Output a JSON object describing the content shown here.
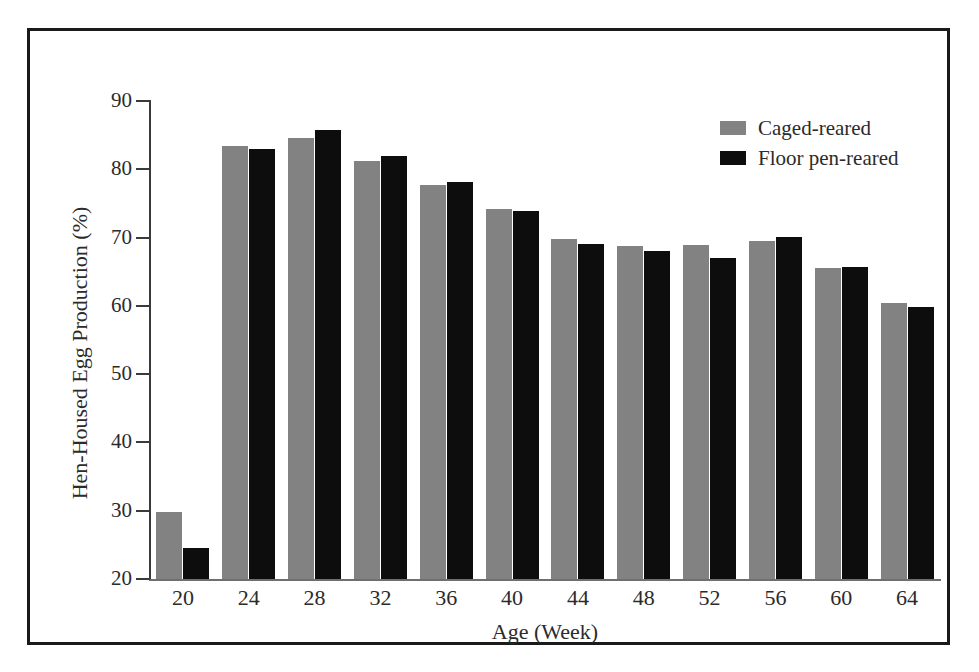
{
  "figure": {
    "border_color": "#1a1a1a",
    "background": "#ffffff"
  },
  "chart_data": {
    "type": "bar",
    "title": "",
    "xlabel": "Age (Week)",
    "ylabel": "Hen-Housed Egg Production (%)",
    "categories": [
      "20",
      "24",
      "28",
      "32",
      "36",
      "40",
      "44",
      "48",
      "52",
      "56",
      "60",
      "64"
    ],
    "series": [
      {
        "name": "Caged-reared",
        "color": "#828282",
        "values": [
          29.8,
          83.4,
          84.6,
          81.2,
          77.7,
          74.2,
          69.8,
          68.8,
          68.9,
          69.5,
          65.6,
          60.4
        ]
      },
      {
        "name": "Floor pen-reared",
        "color": "#0d0d0d",
        "values": [
          24.5,
          83.0,
          85.7,
          82.0,
          78.2,
          73.9,
          69.1,
          68.0,
          67.0,
          70.1,
          65.7,
          59.8
        ]
      }
    ],
    "ylim": [
      20,
      90
    ],
    "yticks": [
      20,
      30,
      40,
      50,
      60,
      70,
      80,
      90
    ],
    "ytick_labels": [
      "20",
      "30",
      "40",
      "50",
      "60",
      "70",
      "80",
      "90"
    ],
    "grid": false,
    "legend_position": "upper-right"
  },
  "legend": {
    "entries": [
      {
        "label": "Caged-reared",
        "color": "#828282"
      },
      {
        "label": "Floor pen-reared",
        "color": "#0d0d0d"
      }
    ]
  }
}
